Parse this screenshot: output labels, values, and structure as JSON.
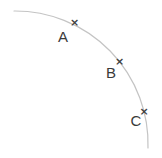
{
  "diagram": {
    "background_color": "#ffffff",
    "arc": {
      "path": "M 14 11 A 133 133 0 0 1 148 148",
      "color": "#c4c4c4",
      "stroke_width": 1.2,
      "center_x": 15,
      "center_y": 144,
      "radius": 133
    },
    "marker": {
      "glyph": "×",
      "color": "#3f3f3f",
      "font_size": 11
    },
    "label_style": {
      "color": "#3a3a3a",
      "font_size": 15
    },
    "points": [
      {
        "label": "A",
        "x": 74.5,
        "y": 22.5,
        "label_x": 63,
        "label_y": 41.5
      },
      {
        "label": "B",
        "x": 119.5,
        "y": 61.5,
        "label_x": 111,
        "label_y": 78
      },
      {
        "label": "C",
        "x": 144,
        "y": 111,
        "label_x": 136,
        "label_y": 126
      }
    ]
  }
}
